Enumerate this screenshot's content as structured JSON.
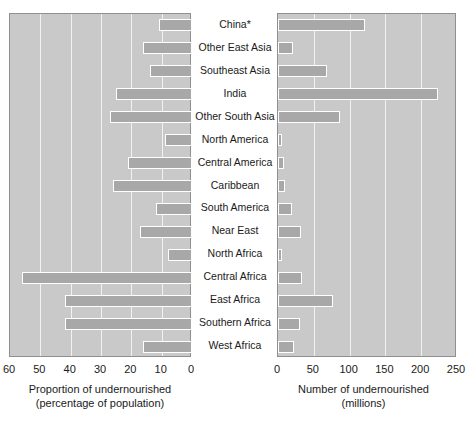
{
  "chart_data": {
    "type": "bar",
    "title": "",
    "subtitle": "",
    "orientation": "horizontal",
    "layout": "back-to-back paired panels sharing category axis",
    "grid": true,
    "legend": null,
    "categories": [
      "China*",
      "Other East Asia",
      "Southeast Asia",
      "India",
      "Other South Asia",
      "North America",
      "Central America",
      "Caribbean",
      "South America",
      "Near East",
      "North Africa",
      "Central Africa",
      "East Africa",
      "Southern Africa",
      "West Africa"
    ],
    "panels": [
      {
        "id": "proportion",
        "position": "left",
        "xlabel": "Proportion of undernourished",
        "xlabel2": "(percentage of population)",
        "units": "percent",
        "xlim": [
          60,
          0
        ],
        "axis_direction": "reversed",
        "ticks": [
          60,
          50,
          40,
          30,
          20,
          10,
          0
        ],
        "values": [
          11,
          16,
          14,
          25,
          27,
          9,
          21,
          26,
          12,
          17,
          8,
          56,
          42,
          42,
          16
        ]
      },
      {
        "id": "number",
        "position": "right",
        "xlabel": "Number of undernourished",
        "xlabel2": "(millions)",
        "units": "millions",
        "xlim": [
          0,
          250
        ],
        "axis_direction": "normal",
        "ticks": [
          0,
          50,
          100,
          150,
          200,
          250
        ],
        "values": [
          121,
          21,
          68,
          223,
          86,
          6,
          8,
          10,
          19,
          32,
          6,
          33,
          77,
          31,
          22
        ]
      }
    ],
    "colors": {
      "panel_background": "#c9c9c9",
      "bar_fill": "#a8a8a8",
      "bar_edge": "#ffffff",
      "gridline": "#f2f2f2",
      "panel_border": "#8f8f8f",
      "text": "#1a1a1a",
      "page_background": "#ffffff"
    }
  }
}
